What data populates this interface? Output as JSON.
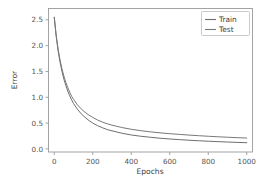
{
  "chart_data": {
    "type": "line",
    "title": "",
    "xlabel": "Epochs",
    "ylabel": "Error",
    "xlim": [
      -30,
      1030
    ],
    "ylim": [
      -0.06,
      2.72
    ],
    "xticks": [
      0,
      200,
      400,
      600,
      800,
      1000
    ],
    "xticklabels": [
      "0",
      "200",
      "400",
      "600",
      "800",
      "1000"
    ],
    "yticks": [
      0.0,
      0.5,
      1.0,
      1.5,
      2.0,
      2.5
    ],
    "yticklabels": [
      "0.0",
      "0.5",
      "1.0",
      "1.5",
      "2.0",
      "2.5"
    ],
    "grid": false,
    "legend_position": "upper right",
    "x": [
      0,
      10,
      20,
      30,
      40,
      50,
      60,
      70,
      80,
      90,
      100,
      120,
      140,
      160,
      180,
      200,
      225,
      250,
      275,
      300,
      350,
      400,
      450,
      500,
      550,
      600,
      650,
      700,
      750,
      800,
      850,
      900,
      950,
      1000
    ],
    "series": [
      {
        "name": "Train",
        "color": "#6e6e6e",
        "values": [
          2.55,
          2.18,
          1.9,
          1.68,
          1.5,
          1.35,
          1.23,
          1.12,
          1.03,
          0.95,
          0.88,
          0.77,
          0.68,
          0.61,
          0.55,
          0.5,
          0.45,
          0.41,
          0.375,
          0.35,
          0.305,
          0.27,
          0.245,
          0.225,
          0.207,
          0.192,
          0.18,
          0.168,
          0.158,
          0.149,
          0.141,
          0.133,
          0.126,
          0.12
        ]
      },
      {
        "name": "Test",
        "color": "#787878",
        "values": [
          2.55,
          2.2,
          1.93,
          1.72,
          1.55,
          1.41,
          1.29,
          1.19,
          1.1,
          1.02,
          0.96,
          0.855,
          0.775,
          0.71,
          0.655,
          0.61,
          0.56,
          0.52,
          0.487,
          0.46,
          0.415,
          0.38,
          0.353,
          0.33,
          0.311,
          0.295,
          0.281,
          0.268,
          0.256,
          0.245,
          0.235,
          0.226,
          0.218,
          0.21
        ]
      }
    ]
  },
  "legend": {
    "entries": [
      {
        "label": "Train"
      },
      {
        "label": "Test"
      }
    ]
  },
  "axes": {
    "x_axis_label": "Epochs",
    "y_axis_label": "Error"
  },
  "colors": {
    "background": "#ffffff",
    "spine": "#9a9a9a",
    "tick_text": "#545454",
    "train_line": "#6e6e6e",
    "test_line": "#787878"
  }
}
